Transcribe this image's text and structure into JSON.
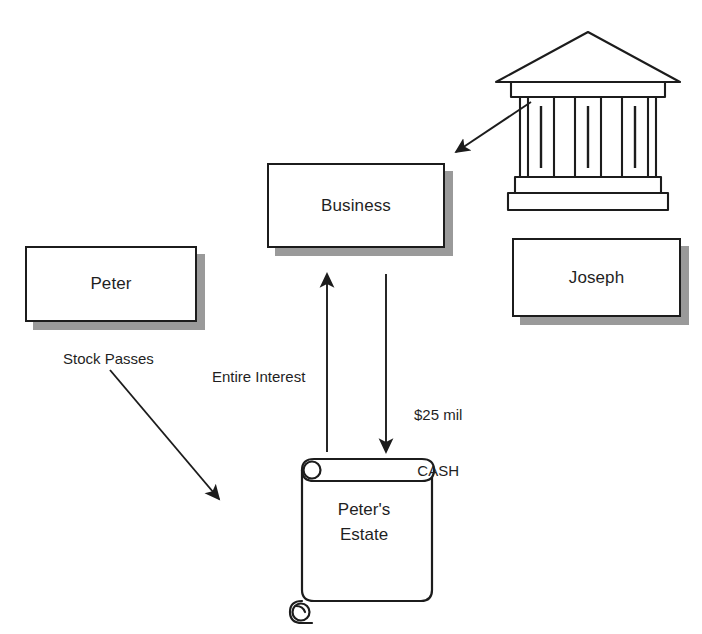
{
  "diagram": {
    "background_color": "#ffffff",
    "stroke_color": "#1c1c1c",
    "shadow_color": "#9a9a9a",
    "nodes": [
      {
        "id": "peter",
        "label": "Peter",
        "shape": "shadowed-rectangle"
      },
      {
        "id": "business",
        "label": "Business",
        "shape": "shadowed-rectangle"
      },
      {
        "id": "joseph",
        "label": "Joseph",
        "shape": "shadowed-rectangle"
      },
      {
        "id": "estate",
        "label_line1": "Peter's",
        "label_line2": "Estate",
        "shape": "scroll"
      },
      {
        "id": "bank",
        "label": "",
        "shape": "classical-building",
        "icon": "bank-icon"
      }
    ],
    "edges": [
      {
        "id": "stock-passes",
        "label": "Stock Passes",
        "from": "peter",
        "to": "estate",
        "direction": "diagonal-down-right"
      },
      {
        "id": "entire-interest",
        "label": "Entire Interest",
        "from": "estate",
        "to": "business",
        "direction": "up"
      },
      {
        "id": "cash",
        "label_line1": "$25 mil",
        "label_line2": "CASH",
        "from": "business",
        "to": "estate",
        "direction": "down"
      },
      {
        "id": "bank-to-business",
        "label": "",
        "from": "bank",
        "to": "business",
        "direction": "diagonal-down-left"
      }
    ]
  }
}
